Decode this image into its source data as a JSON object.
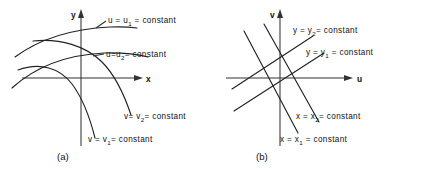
{
  "figure": {
    "title": "",
    "background_color": "#ffffff",
    "line_color": "#222222"
  },
  "panel_a": {
    "caption": "(a)",
    "axes": {
      "x_label": "x",
      "y_label": "y"
    },
    "curve_labels": [
      {
        "id": "u1",
        "text_parts": {
          "pre": "u = u",
          "sub": "1",
          "post": " = constant"
        },
        "full": "u = u1 = constant"
      },
      {
        "id": "u2",
        "text_parts": {
          "pre": "u=u",
          "sub": "2",
          "post": "= constant"
        },
        "full": "u=u2= constant"
      },
      {
        "id": "v2",
        "text_parts": {
          "pre": "v= v",
          "sub": "2",
          "post": "= constant"
        },
        "full": "v= v2= constant"
      },
      {
        "id": "v1",
        "text_parts": {
          "pre": "v = v",
          "sub": "1",
          "post": "= constant"
        },
        "full": "v = v1= constant"
      }
    ]
  },
  "panel_b": {
    "caption": "(b)",
    "axes": {
      "x_label": "u",
      "y_label": "v"
    },
    "curve_labels": [
      {
        "id": "y2",
        "text_parts": {
          "pre": "y = y",
          "sub": "2",
          "post": "= constant"
        },
        "full": "y = y2= constant"
      },
      {
        "id": "y1",
        "text_parts": {
          "pre": "y = y",
          "sub": "1",
          "post": " = constant"
        },
        "full": "y = y1 = constant"
      },
      {
        "id": "x2",
        "text_parts": {
          "pre": "x = x",
          "sub": "2",
          "post": "=  constant"
        },
        "full": "x = x2= constant"
      },
      {
        "id": "x1",
        "text_parts": {
          "pre": "x = x",
          "sub": "1",
          "post": " = constant"
        },
        "full": "x = x1 = constant"
      }
    ]
  }
}
